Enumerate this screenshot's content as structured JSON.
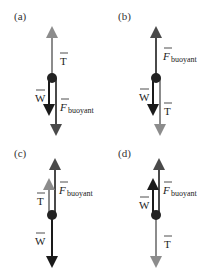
{
  "panels": [
    {
      "id": "a",
      "label": "(a)",
      "labels": {
        "T": "T",
        "W": "W",
        "F": "F",
        "F_sub": "buoyant"
      }
    },
    {
      "id": "b",
      "label": "(b)",
      "labels": {
        "T": "T",
        "W": "W",
        "F": "F",
        "F_sub": "buoyant"
      }
    },
    {
      "id": "c",
      "label": "(c)",
      "labels": {
        "T": "T",
        "W": "W",
        "F": "F",
        "F_sub": "buoyant"
      }
    },
    {
      "id": "d",
      "label": "(d)",
      "labels": {
        "T": "T",
        "W": "W",
        "F": "F",
        "F_sub": "buoyant"
      }
    }
  ],
  "colors": {
    "weight": "#1a1a1a",
    "buoyant": "#4a4a4a",
    "tension": "#8c8c8c",
    "dot": "#222222"
  }
}
